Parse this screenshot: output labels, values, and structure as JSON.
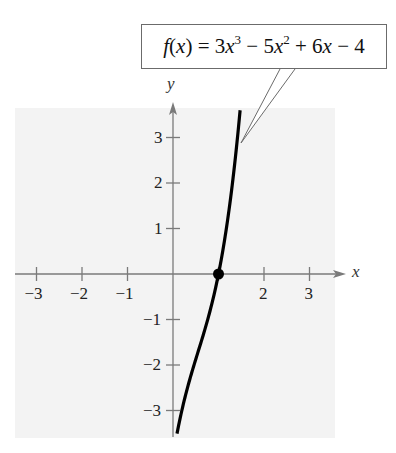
{
  "chart_data": {
    "type": "line",
    "function": "3x^3 - 5x^2 + 6x - 4",
    "callout": {
      "parts": [
        "f",
        "(",
        "x",
        ") = 3",
        "x",
        "3",
        " − 5",
        "x",
        "2",
        " + 6",
        "x",
        " − 4"
      ]
    },
    "xlabel": "x",
    "ylabel": "y",
    "xlim": [
      -3.5,
      3.5
    ],
    "ylim": [
      -3.5,
      3.5
    ],
    "x_ticks": [
      -3,
      -2,
      -1,
      1,
      2,
      3
    ],
    "x_tick_labels": [
      "−3",
      "−2",
      "−1",
      "",
      "2",
      "3"
    ],
    "y_ticks": [
      -3,
      -2,
      -1,
      1,
      2,
      3
    ],
    "y_tick_labels": [
      "−3",
      "−2",
      "−1",
      "1",
      "2",
      "3"
    ],
    "grid": false,
    "background": "#f3f3f3",
    "series": [
      {
        "name": "f(x)",
        "color": "#000000",
        "x": [
          0.09,
          0.2,
          0.3,
          0.4,
          0.5,
          0.6,
          0.7,
          0.8,
          0.9,
          1.0,
          1.1,
          1.2,
          1.3,
          1.4,
          1.47
        ],
        "y": [
          -3.5,
          -3.38,
          -2.57,
          -2.08,
          -1.88,
          -1.55,
          -1.22,
          -0.86,
          -0.46,
          0.0,
          0.54,
          1.18,
          1.94,
          2.83,
          3.55
        ]
      }
    ],
    "points": [
      {
        "label": "root",
        "x": 1,
        "y": 0
      }
    ]
  },
  "colors": {
    "axis": "#7a7a7a",
    "curve": "#000000",
    "plot_bg": "#f3f3f3",
    "callout_border": "#6b6b6b"
  }
}
